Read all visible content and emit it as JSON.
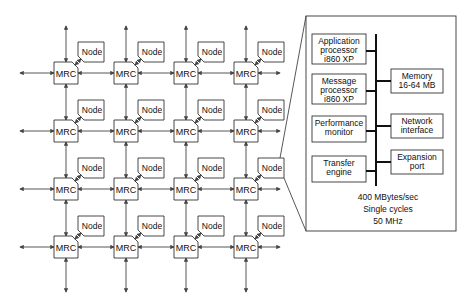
{
  "diagram": {
    "mesh": {
      "rows": 4,
      "cols": 4,
      "router_label": "MRC",
      "node_label": "Node"
    },
    "detail": {
      "blocks_left": [
        {
          "id": "app",
          "lines": [
            "Application",
            "processor",
            "i860 XP"
          ]
        },
        {
          "id": "msg",
          "lines": [
            "Message",
            "processor",
            "i860 XP"
          ]
        },
        {
          "id": "perf",
          "lines": [
            "Performance",
            "monitor"
          ]
        },
        {
          "id": "xfer",
          "lines": [
            "Transfer",
            "engine"
          ]
        }
      ],
      "blocks_right": [
        {
          "id": "mem",
          "lines": [
            "Memory",
            "16-64 MB"
          ]
        },
        {
          "id": "net",
          "lines": [
            "Network",
            "interface"
          ]
        },
        {
          "id": "exp",
          "lines": [
            "Expansion",
            "port"
          ]
        }
      ],
      "specs": [
        "400 MBytes/sec",
        "Single cycles",
        "50 MHz"
      ]
    }
  }
}
